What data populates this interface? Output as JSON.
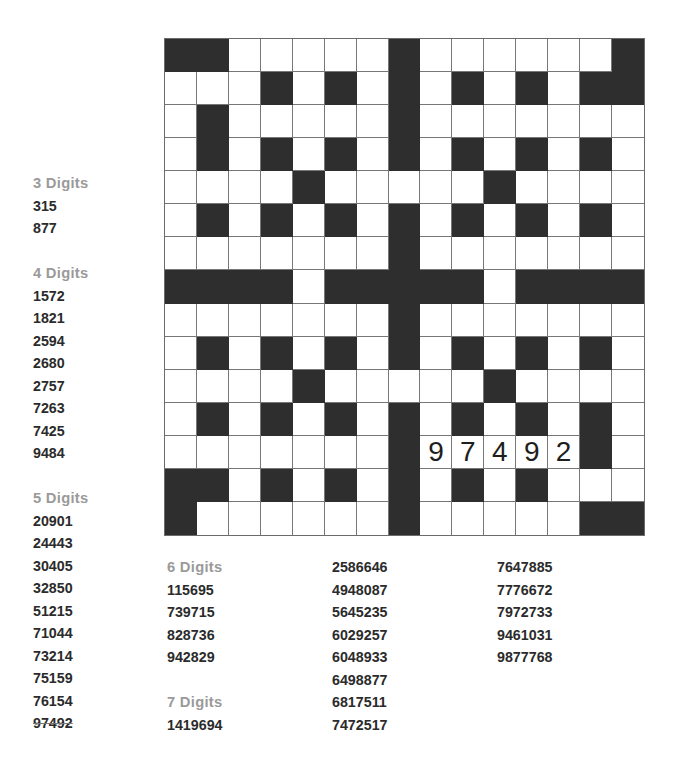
{
  "puzzle": {
    "type": "number fill-in",
    "rows": 15,
    "cols": 15,
    "colors": {
      "block": "#2e2e2e",
      "cell": "#ffffff",
      "header": "#9a9a9a",
      "number": "#2b2b2b"
    },
    "grid": [
      "BBWWWWWBWWWWWWB",
      "WWWBWBWBWBWBWBB",
      "WBWWWWWBWWWWWWW",
      "WBWBWBWBWBWBWBW",
      "WWWWBWWWWWBWWWW",
      "WBWBWBWBWBWBWBW",
      "WWWWWWWBWWWWWWW",
      "BBBBWBBBBBWBBBB",
      "WWWWWWWBWWWWWWW",
      "WBWBWBWBWBWBWBW",
      "WWWWBWWWWWBWWWW",
      "WBWBWBWBWBWBWBW",
      "WWWWWWWB97492BW",
      "BBWBWBWBWBWBWWW",
      "BWWWWWWBWWWWWBB"
    ],
    "filled_entry": {
      "row": 12,
      "col": 8,
      "direction": "across",
      "value": "97492"
    }
  },
  "word_lists": {
    "three": {
      "header": "3 Digits",
      "items": [
        "315",
        "877"
      ]
    },
    "four": {
      "header": "4 Digits",
      "items": [
        "1572",
        "1821",
        "2594",
        "2680",
        "2757",
        "7263",
        "7425",
        "9484"
      ]
    },
    "five": {
      "header": "5 Digits",
      "items": [
        "20901",
        "24443",
        "30405",
        "32850",
        "51215",
        "71044",
        "73214",
        "75159",
        "76154",
        "97492"
      ],
      "struck": [
        "97492"
      ]
    },
    "six": {
      "header": "6 Digits",
      "items": [
        "115695",
        "739715",
        "828736",
        "942829"
      ]
    },
    "seven": {
      "header": "7 Digits",
      "items": [
        "1419694",
        "2586646",
        "4948087",
        "5645235",
        "6029257",
        "6048933",
        "6498877",
        "6817511",
        "7472517",
        "7647885",
        "7776672",
        "7972733",
        "9461031",
        "9877768"
      ]
    }
  }
}
